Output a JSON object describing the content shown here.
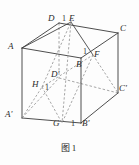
{
  "figure": {
    "caption_label": "图",
    "caption_number": "1",
    "type": "cube-solid-geometry-diagram",
    "stroke_color": "#3a3a3a",
    "dashed_color": "#8a8a8a",
    "background": "#fdfdfd"
  },
  "vertices": {
    "A": {
      "label": "A",
      "x": 22,
      "y": 48,
      "hidden": false,
      "lx": 8,
      "ly": 42
    },
    "D": {
      "label": "D",
      "x": 59,
      "y": 23,
      "hidden": false,
      "lx": 48,
      "ly": 16
    },
    "C": {
      "label": "C",
      "x": 118,
      "y": 33,
      "hidden": false,
      "lx": 120,
      "ly": 26
    },
    "B": {
      "label": "B",
      "x": 81,
      "y": 58,
      "hidden": true,
      "lx": 77,
      "ly": 62
    },
    "A'": {
      "label": "A'",
      "x": 22,
      "y": 118,
      "hidden": false,
      "lx": 6,
      "ly": 112
    },
    "D'": {
      "label": "D'",
      "x": 59,
      "y": 78,
      "hidden": true,
      "lx": 52,
      "ly": 72
    },
    "C'": {
      "label": "C'",
      "x": 118,
      "y": 93,
      "hidden": false,
      "lx": 120,
      "ly": 86
    },
    "B'": {
      "label": "B'",
      "x": 81,
      "y": 123,
      "hidden": false,
      "lx": 82,
      "ly": 121
    }
  },
  "marked_points": {
    "E": {
      "label": "E",
      "x": 71,
      "y": 22,
      "lx": 70,
      "ly": 16
    },
    "F": {
      "label": "F",
      "x": 93,
      "y": 55,
      "lx": 95,
      "ly": 52
    },
    "G": {
      "label": "G",
      "x": 62,
      "y": 123,
      "lx": 54,
      "ly": 121
    },
    "H": {
      "label": "H",
      "x": 42,
      "y": 87,
      "lx": 33,
      "ly": 82
    }
  },
  "length_markers": [
    {
      "value": "1",
      "on": "DE",
      "x": 64,
      "y": 16
    },
    {
      "value": "1",
      "on": "BF",
      "x": 83,
      "y": 50
    },
    {
      "value": "1",
      "on": "HD'",
      "x": 46,
      "y": 85
    },
    {
      "value": "1",
      "on": "GB'",
      "x": 72,
      "y": 121
    }
  ],
  "edges_solid": [
    {
      "name": "A-D",
      "from": "A",
      "to": "D"
    },
    {
      "name": "D-C",
      "from": "D",
      "to": "C"
    },
    {
      "name": "A-A'",
      "from": "A",
      "to": "A'"
    },
    {
      "name": "C-C'",
      "from": "C",
      "to": "C'"
    },
    {
      "name": "A'-B'",
      "from": "A'",
      "to": "B'"
    },
    {
      "name": "B'-C'",
      "from": "B'",
      "to": "C'"
    },
    {
      "name": "B-B'",
      "from": "B",
      "to": "B'"
    },
    {
      "name": "A-B",
      "from": "A",
      "to": "B"
    },
    {
      "name": "B-C",
      "from": "B",
      "to": "C"
    }
  ],
  "edges_dashed": [
    {
      "name": "D-D'",
      "from": "D",
      "to": "D'"
    },
    {
      "name": "A'-D'",
      "from": "A'",
      "to": "D'"
    },
    {
      "name": "D'-C'",
      "from": "D'",
      "to": "C'"
    }
  ],
  "section_lines": [
    {
      "name": "E-F",
      "from": "E",
      "to": "F",
      "style": "solid"
    },
    {
      "name": "A-E",
      "from": "A",
      "to": "E",
      "style": "solid"
    },
    {
      "name": "E-G",
      "from": "E",
      "to": "G",
      "style": "dashed"
    },
    {
      "name": "F-G",
      "from": "F",
      "to": "G",
      "style": "dashed"
    },
    {
      "name": "H-G",
      "from": "H",
      "to": "G",
      "style": "dashed"
    },
    {
      "name": "A'-H",
      "from": "A'",
      "to": "H",
      "style": "dashed"
    },
    {
      "name": "H-E",
      "from": "H",
      "to": "E",
      "style": "dashed"
    },
    {
      "name": "H-F",
      "from": "H",
      "to": "F",
      "style": "dashed"
    },
    {
      "name": "F-C'",
      "from": "F",
      "to": "C'",
      "style": "dashed"
    }
  ]
}
